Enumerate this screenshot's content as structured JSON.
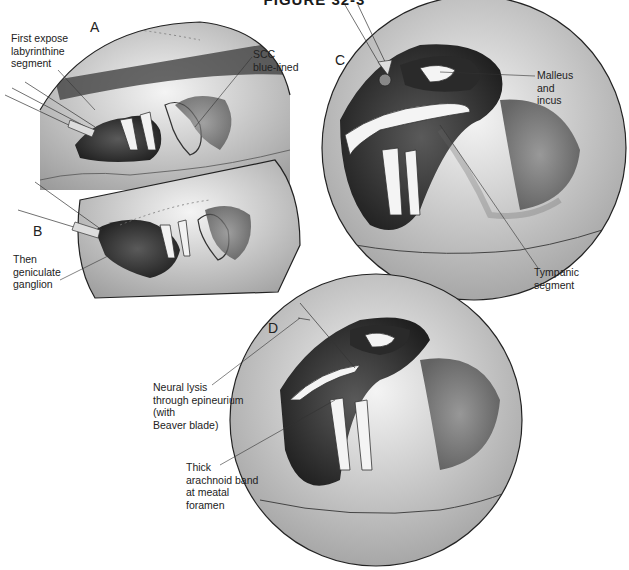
{
  "figure": {
    "title": "FIGURE 32-3"
  },
  "panels": [
    {
      "letter": "A",
      "labels": [
        "First expose\nlabyrinthine\nsegment",
        "SCC\nblue-lined"
      ]
    },
    {
      "letter": "B",
      "labels": [
        "Then\ngeniculate\nganglion"
      ]
    },
    {
      "letter": "C",
      "labels": [
        "Malleus\nand\nincus",
        "Tympanic\nsegment"
      ]
    },
    {
      "letter": "D",
      "labels": [
        "Neural lysis\nthrough epineurium\n(with\nBeaver blade)",
        "Thick\narachnoid band\nat meatal\nforamen"
      ]
    }
  ]
}
